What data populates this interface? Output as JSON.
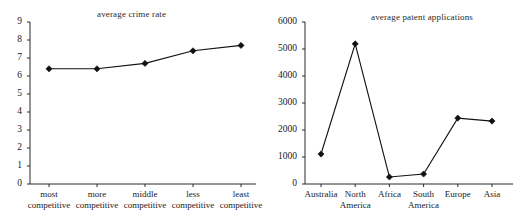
{
  "figure": {
    "background_color": "#ffffff",
    "ink_color": "#111111",
    "panel_count": 2
  },
  "chart_data": [
    {
      "type": "line",
      "id": "average-crime-rate",
      "title": "average crime rate",
      "xlabel": "",
      "ylabel": "",
      "categories": [
        "most competitive",
        "more competitive",
        "middle competitive",
        "less competitive",
        "least competitive"
      ],
      "category_lines": [
        [
          "most",
          "competitive"
        ],
        [
          "more",
          "competitive"
        ],
        [
          "middle",
          "competitive"
        ],
        [
          "less",
          "competitive"
        ],
        [
          "least",
          "competitive"
        ]
      ],
      "values": [
        6.4,
        6.4,
        6.7,
        7.4,
        7.7
      ],
      "ylim": [
        0,
        9
      ],
      "yticks": [
        0,
        1,
        2,
        3,
        4,
        5,
        6,
        7,
        8,
        9
      ],
      "ytick_labels": [
        "0",
        "1",
        "2",
        "3",
        "4",
        "5",
        "6",
        "7",
        "8",
        "9"
      ],
      "grid": false,
      "legend": false,
      "marker": "diamond",
      "line_color": "#111111"
    },
    {
      "type": "line",
      "id": "average-patent-applications",
      "title": "average patent applications",
      "xlabel": "",
      "ylabel": "",
      "categories": [
        "Australia",
        "North America",
        "Africa",
        "South America",
        "Europe",
        "Asia"
      ],
      "category_lines": [
        [
          "Australia",
          ""
        ],
        [
          "North",
          "America"
        ],
        [
          "Africa",
          ""
        ],
        [
          "South",
          "America"
        ],
        [
          "Europe",
          ""
        ],
        [
          "Asia",
          ""
        ]
      ],
      "values": [
        1110,
        5190,
        260,
        370,
        2440,
        2330
      ],
      "ylim": [
        0,
        6000
      ],
      "yticks": [
        0,
        1000,
        2000,
        3000,
        4000,
        5000,
        6000
      ],
      "ytick_labels": [
        "0",
        "1000",
        "2000",
        "3000",
        "4000",
        "5000",
        "6000"
      ],
      "grid": false,
      "legend": false,
      "marker": "diamond",
      "line_color": "#111111"
    }
  ]
}
